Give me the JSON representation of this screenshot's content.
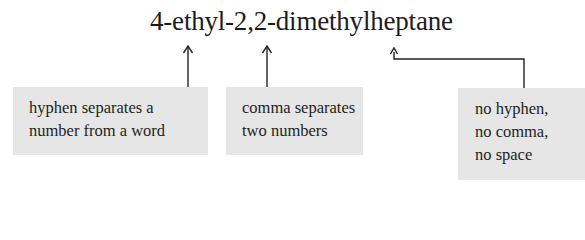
{
  "title": "4-ethyl-2,2-dimethylheptane",
  "annotations": [
    {
      "lines": [
        "hyphen separates a",
        "number from a word"
      ],
      "points_to": "hyphen after 4"
    },
    {
      "lines": [
        "comma separates",
        "two numbers"
      ],
      "points_to": "comma between 2,2"
    },
    {
      "lines": [
        "no hyphen,",
        "no comma,",
        "no space"
      ],
      "points_to": "join between methyl and heptane"
    }
  ],
  "colors": {
    "box_fill": "#e6e6e6",
    "text": "#1e1e1e",
    "arrow": "#222222"
  }
}
